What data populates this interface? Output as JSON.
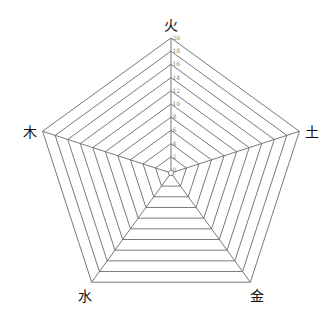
{
  "chart_data": {
    "type": "radar",
    "title": "",
    "axes": [
      "火",
      "土",
      "金",
      "水",
      "木"
    ],
    "series": [],
    "radial_ticks": [
      0,
      2,
      4,
      6,
      8,
      10,
      12,
      14,
      16,
      18,
      20
    ],
    "radial_range": [
      0,
      20
    ],
    "grid": true,
    "grid_shape": "pentagon",
    "legend": "none",
    "colors": {
      "grid": "#6a6a6a",
      "tick_label": "#777777",
      "axis_label": "#111111",
      "background": "#ffffff"
    }
  },
  "layout": {
    "center": [
      171,
      173
    ],
    "outer_radius": 135,
    "inner_radius": 3
  }
}
